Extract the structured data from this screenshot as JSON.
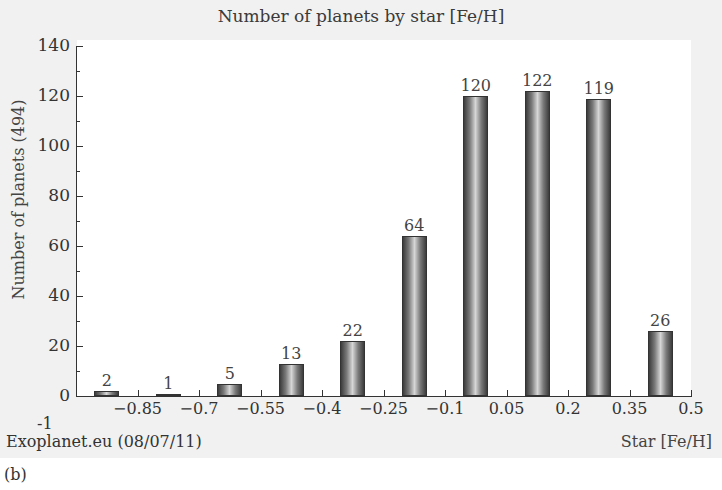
{
  "chart_data": {
    "type": "bar",
    "title": "Number of planets by star [Fe/H]",
    "xlabel": "Star [Fe/H]",
    "ylabel": "Number of planets (494)",
    "x_tick_labels": [
      "-0.85",
      "-0.7",
      "-0.55",
      "-0.4",
      "-0.25",
      "-0.1",
      "0.05",
      "0.2",
      "0.35",
      "0.5"
    ],
    "y_tick_labels": [
      "0",
      "20",
      "40",
      "60",
      "80",
      "100",
      "120",
      "140"
    ],
    "extra_y_label": "-1",
    "bins": [
      {
        "range": [
          -1.0,
          -0.85
        ],
        "value": 2
      },
      {
        "range": [
          -0.85,
          -0.7
        ],
        "value": 1
      },
      {
        "range": [
          -0.7,
          -0.55
        ],
        "value": 5
      },
      {
        "range": [
          -0.55,
          -0.4
        ],
        "value": 13
      },
      {
        "range": [
          -0.4,
          -0.25
        ],
        "value": 22
      },
      {
        "range": [
          -0.25,
          -0.1
        ],
        "value": 64
      },
      {
        "range": [
          -0.1,
          0.05
        ],
        "value": 120
      },
      {
        "range": [
          0.05,
          0.2
        ],
        "value": 122
      },
      {
        "range": [
          0.2,
          0.35
        ],
        "value": 119
      },
      {
        "range": [
          0.35,
          0.5
        ],
        "value": 26
      }
    ],
    "values": [
      2,
      1,
      5,
      13,
      22,
      64,
      120,
      122,
      119,
      26
    ],
    "xlim": [
      -1.0,
      0.5
    ],
    "ylim": [
      0,
      140
    ],
    "grid": false,
    "legend": null,
    "source_note": "Exoplanet.eu (08/07/11)",
    "panel_caption": "(b)"
  }
}
